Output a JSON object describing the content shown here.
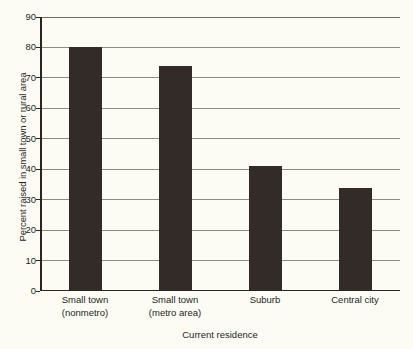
{
  "chart_data": {
    "type": "bar",
    "title": "",
    "xlabel": "Current residence",
    "ylabel": "Percent raised in small town or rural area",
    "categories": [
      "Small town (nonmetro)",
      "Small town (metro area)",
      "Suburb",
      "Central city"
    ],
    "category_lines": [
      [
        "Small town",
        "(nonmetro)"
      ],
      [
        "Small town",
        "(metro area)"
      ],
      [
        "Suburb",
        ""
      ],
      [
        "Central city",
        ""
      ]
    ],
    "values": [
      80,
      74,
      41,
      34
    ],
    "ylim": [
      0,
      90
    ],
    "ytick_values": [
      0,
      10,
      20,
      30,
      40,
      50,
      60,
      70,
      80,
      90
    ],
    "ytick_labels": [
      "0",
      "10",
      "20",
      "30",
      "40",
      "50",
      "60",
      "70",
      "80",
      "90"
    ],
    "grid": "horizontal",
    "legend": "none",
    "colors": {
      "bar": "#332b28",
      "background": "#fcfcf4",
      "gridline": "#8d8b83",
      "axis": "#2b2522",
      "text": "#241f1c"
    }
  }
}
